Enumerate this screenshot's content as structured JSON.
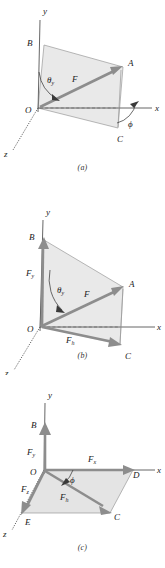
{
  "figure": {
    "panel_count": 3,
    "colors": {
      "shade": "#e9e9e9",
      "vector": "#8d8d8d",
      "axis": "#555555",
      "thin_edge": "#9a9a9a",
      "text": "#1a1a1a",
      "background": "#ffffff"
    }
  },
  "panels": [
    {
      "id": "a",
      "caption": "(a)",
      "axes": {
        "x": "x",
        "y": "y",
        "z": "z"
      },
      "points": {
        "origin": "O",
        "b": "B",
        "a": "A",
        "c": "C"
      },
      "vectors": [
        {
          "name": "F",
          "label": "F",
          "from": "O",
          "to": "A"
        }
      ],
      "angles": [
        {
          "name": "theta-y",
          "label": "θ",
          "sub": "y"
        },
        {
          "name": "phi",
          "label": "ϕ",
          "sub": ""
        }
      ]
    },
    {
      "id": "b",
      "caption": "(b)",
      "axes": {
        "x": "x",
        "y": "y",
        "z": "z"
      },
      "points": {
        "origin": "O",
        "b": "B",
        "a": "A",
        "c": "C"
      },
      "vectors": [
        {
          "name": "F",
          "label": "F",
          "from": "O",
          "to": "A"
        },
        {
          "name": "Fy",
          "label": "F",
          "sub": "y",
          "from": "O",
          "to": "B"
        },
        {
          "name": "Fh",
          "label": "F",
          "sub": "h",
          "from": "O",
          "to": "C"
        }
      ],
      "angles": [
        {
          "name": "theta-y",
          "label": "θ",
          "sub": "y"
        }
      ]
    },
    {
      "id": "c",
      "caption": "(c)",
      "axes": {
        "x": "x",
        "y": "y",
        "z": "z"
      },
      "points": {
        "origin": "O",
        "b": "B",
        "d": "D",
        "c": "C",
        "e": "E"
      },
      "vectors": [
        {
          "name": "Fy",
          "label": "F",
          "sub": "y",
          "from": "O",
          "to": "B"
        },
        {
          "name": "Fx",
          "label": "F",
          "sub": "x",
          "from": "O",
          "to": "D"
        },
        {
          "name": "Fz",
          "label": "F",
          "sub": "z",
          "from": "O",
          "to": "E"
        },
        {
          "name": "Fh",
          "label": "F",
          "sub": "h",
          "from": "O",
          "to": "C"
        }
      ],
      "angles": [
        {
          "name": "phi",
          "label": "ϕ",
          "sub": ""
        }
      ]
    }
  ]
}
